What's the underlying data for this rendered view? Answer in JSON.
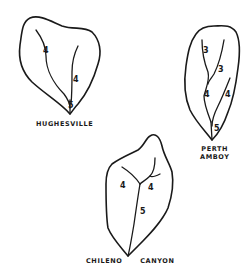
{
  "diagram": {
    "type": "watershed stream-order sketches",
    "basins": [
      {
        "name": "HUGHESVILLE",
        "label_lines": [
          "HUGHESVILLE"
        ],
        "stream_orders": [
          "4",
          "4",
          "5"
        ]
      },
      {
        "name": "PERTH AMBOY",
        "label_lines": [
          "PERTH",
          "AMBOY"
        ],
        "stream_orders": [
          "3",
          "3",
          "4",
          "4",
          "5"
        ]
      },
      {
        "name": "CHILENO CANYON",
        "label_lines": [
          "CHILENO",
          "CANYON"
        ],
        "stream_orders": [
          "4",
          "4",
          "5"
        ]
      }
    ],
    "colors": {
      "line": "#1a1a1a",
      "background": "#ffffff"
    }
  }
}
